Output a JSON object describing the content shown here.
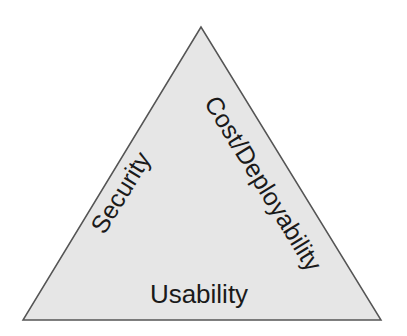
{
  "diagram": {
    "type": "triangle",
    "fill_color": "#e6e6e6",
    "stroke_color": "#555555",
    "vertices": {
      "apex": [
        201,
        27
      ],
      "base_left": [
        23,
        320
      ],
      "base_right": [
        381,
        320
      ]
    },
    "labels": {
      "left_side": "Security",
      "right_side": "Cost/Deployability",
      "bottom": "Usability"
    }
  }
}
